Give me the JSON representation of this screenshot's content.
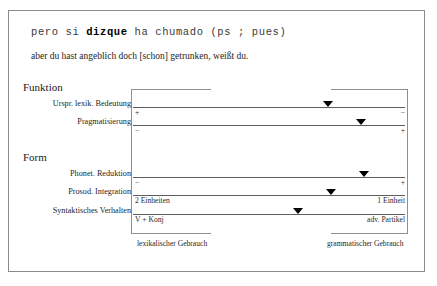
{
  "example": {
    "source_prefix": "pero si ",
    "source_keyword": "dizque",
    "source_suffix": " ha chumado (ps ; pues)",
    "translation": "aber du hast angeblich doch [schon] getrunken, weißt du."
  },
  "chart_data": {
    "type": "bar",
    "title": "",
    "xlabel": "",
    "ylabel": "",
    "axis_left_caption": "lexikalischer Gebrauch",
    "axis_right_caption": "grammatischer Gebrauch",
    "xlim": [
      0,
      100
    ],
    "grid": false,
    "legend": "none",
    "sections": [
      {
        "name": "Funktion",
        "rows": [
          {
            "label": "Urspr. lexik. Bedeutung",
            "left_pole": "+",
            "right_pole": "−",
            "value": 72
          },
          {
            "label": "Pragmatisierung",
            "left_pole": "−",
            "right_pole": "+",
            "value": 84
          }
        ]
      },
      {
        "name": "Form",
        "rows": [
          {
            "label": "Phonet. Reduktion",
            "left_pole": "−",
            "right_pole": "+",
            "value": 85
          },
          {
            "label": "Prosod. Integration",
            "left_pole": "2 Einheiten",
            "right_pole": "1 Einheit",
            "value": 73
          },
          {
            "label": "Syntaktisches Verhalten",
            "left_pole": "V + Konj",
            "right_pole": "adv. Partikel",
            "value": 61
          }
        ]
      }
    ]
  }
}
